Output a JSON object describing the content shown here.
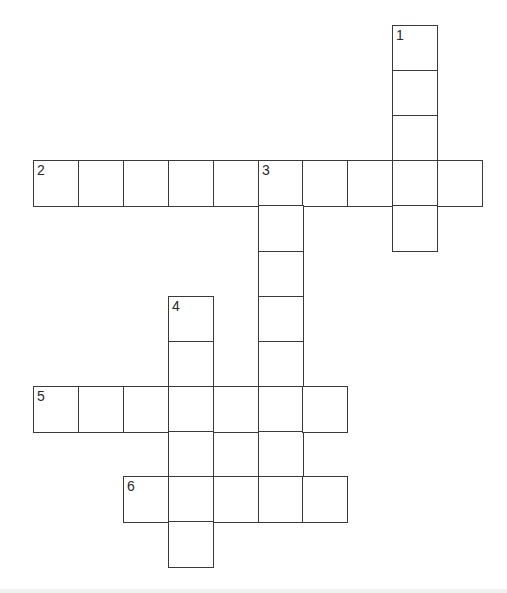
{
  "puzzle": {
    "type": "crossword",
    "grid": {
      "origin_x": 33,
      "origin_y": 25,
      "cell_pitch_x": 44.9,
      "cell_pitch_y": 45.1,
      "columns": 10,
      "rows": 12,
      "border_color": "#3a3a3a",
      "cell_fill": "#ffffff",
      "number_color": "#2a2a2a"
    },
    "entries": [
      {
        "number": "1",
        "direction": "down",
        "row": 0,
        "col": 8,
        "length": 5,
        "value": ""
      },
      {
        "number": "2",
        "direction": "across",
        "row": 3,
        "col": 0,
        "length": 10,
        "value": ""
      },
      {
        "number": "3",
        "direction": "down",
        "row": 3,
        "col": 5,
        "length": 8,
        "value": ""
      },
      {
        "number": "4",
        "direction": "down",
        "row": 6,
        "col": 3,
        "length": 6,
        "value": ""
      },
      {
        "number": "5",
        "direction": "across",
        "row": 8,
        "col": 0,
        "length": 7,
        "value": ""
      },
      {
        "number": "6",
        "direction": "across",
        "row": 10,
        "col": 2,
        "length": 5,
        "value": ""
      }
    ],
    "clue_numbers": [
      "1",
      "2",
      "3",
      "4",
      "5",
      "6"
    ]
  }
}
